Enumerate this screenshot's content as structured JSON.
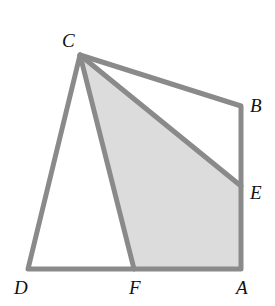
{
  "diagram": {
    "points": {
      "C": {
        "label": "C",
        "x": 80,
        "y": 55
      },
      "B": {
        "label": "B",
        "x": 241,
        "y": 106
      },
      "E": {
        "label": "E",
        "x": 241,
        "y": 186
      },
      "A": {
        "label": "A",
        "x": 241,
        "y": 269
      },
      "D": {
        "label": "D",
        "x": 28,
        "y": 269
      },
      "F": {
        "label": "F",
        "x": 134,
        "y": 269
      }
    },
    "shaded_region": "CEAF",
    "colors": {
      "line": "#8a8a8a",
      "shade": "#dcdcdc",
      "label": "#111111"
    }
  }
}
